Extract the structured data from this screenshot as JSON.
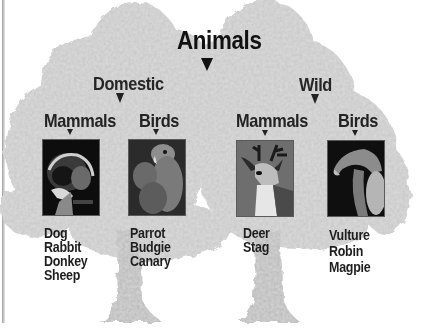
{
  "diagram": {
    "title": "Animals",
    "colors": {
      "canopy": "#cdcdcd",
      "canopy_light": "#dcdcdc",
      "trunk": "#bdbdbd",
      "text": "#1c1c1c"
    },
    "groups": [
      {
        "label": "Domestic",
        "subgroups": [
          {
            "label": "Mammals",
            "photo": "dog-photo",
            "items": [
              "Dog",
              "Rabbit",
              "Donkey",
              "Sheep"
            ]
          },
          {
            "label": "Birds",
            "photo": "parrot-photo",
            "items": [
              "Parrot",
              "Budgie",
              "Canary"
            ]
          }
        ]
      },
      {
        "label": "Wild",
        "subgroups": [
          {
            "label": "Mammals",
            "photo": "deer-photo",
            "items": [
              "Deer",
              "Stag"
            ]
          },
          {
            "label": "Birds",
            "photo": "vulture-photo",
            "items": [
              "Vulture",
              "Robin",
              "Magpie"
            ]
          }
        ]
      }
    ]
  }
}
